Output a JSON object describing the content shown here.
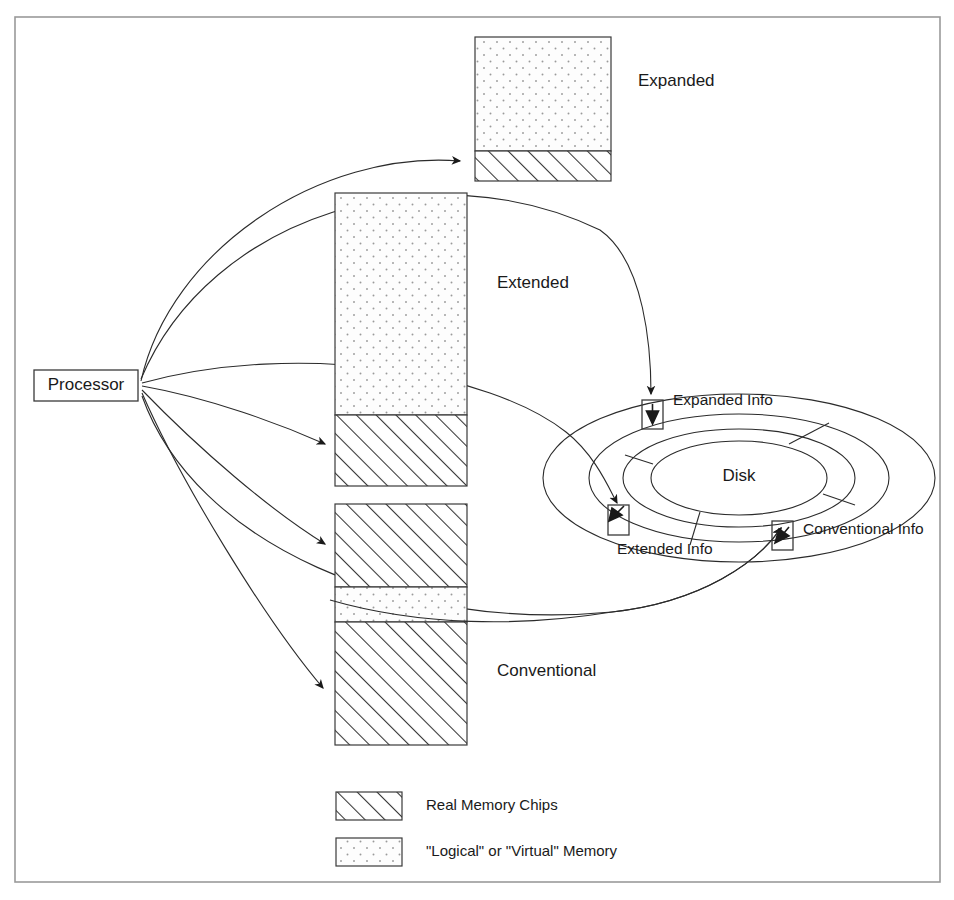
{
  "diagram": {
    "frame": {
      "x": 15,
      "y": 17,
      "width": 925,
      "height": 865
    },
    "colors": {
      "line": "#2b2b2b",
      "box_stroke": "#3a3a3a",
      "frame": "#9a9a9a",
      "text": "#1a1a1a",
      "hatch": "#333333",
      "dot": "#8a8a8a",
      "background": "#ffffff"
    },
    "processor": {
      "label": "Processor",
      "x": 34,
      "y": 370,
      "width": 104,
      "height": 31,
      "fan_origin": {
        "x": 140,
        "y": 384
      }
    },
    "memory_blocks": [
      {
        "name": "expanded",
        "label": "Expanded",
        "label_x": 638,
        "label_y": 86,
        "x": 475,
        "y": 37,
        "width": 136,
        "height": 144,
        "segments": [
          {
            "fill": "dotted",
            "from": 0,
            "to": 114
          },
          {
            "fill": "hatched",
            "from": 114,
            "to": 144
          }
        ]
      },
      {
        "name": "extended",
        "label": "Extended",
        "label_x": 497,
        "label_y": 288,
        "x": 335,
        "y": 193,
        "width": 132,
        "height": 293,
        "segments": [
          {
            "fill": "dotted",
            "from": 0,
            "to": 222
          },
          {
            "fill": "hatched",
            "from": 222,
            "to": 293
          }
        ]
      },
      {
        "name": "conventional",
        "label": "Conventional",
        "label_x": 497,
        "label_y": 676,
        "x": 335,
        "y": 504,
        "width": 132,
        "height": 241,
        "segments": [
          {
            "fill": "hatched",
            "from": 0,
            "to": 83
          },
          {
            "fill": "dotted",
            "from": 83,
            "to": 118
          },
          {
            "fill": "hatched",
            "from": 118,
            "to": 241
          }
        ]
      }
    ],
    "disk": {
      "label": "Disk",
      "label_x": 739,
      "label_y": 477,
      "center_x": 739,
      "center_y": 478,
      "ellipses": [
        {
          "rx": 196,
          "ry": 84
        },
        {
          "rx": 150,
          "ry": 64
        },
        {
          "rx": 116,
          "ry": 49
        },
        {
          "rx": 88,
          "ry": 37
        }
      ],
      "sector_lines": [
        {
          "angle_deg": -55
        },
        {
          "angle_deg": 160
        },
        {
          "angle_deg": 20
        },
        {
          "angle_deg": 108
        }
      ]
    },
    "disk_markers": [
      {
        "name": "expanded-info",
        "label": "Expanded Info",
        "box_x": 642,
        "box_y": 400,
        "box_w": 21,
        "box_h": 29,
        "label_x": 673,
        "label_y": 404,
        "label_anchor": "start",
        "arrow_dir": "down"
      },
      {
        "name": "extended-info",
        "label": "Extended Info",
        "box_x": 608,
        "box_y": 505,
        "box_w": 21,
        "box_h": 30,
        "label_x": 618,
        "label_y": 554,
        "label_anchor": "start",
        "arrow_dir": "down-left"
      },
      {
        "name": "conventional-info",
        "label": "Conventional Info",
        "box_x": 772,
        "box_y": 521,
        "box_w": 21,
        "box_h": 29,
        "label_x": 805,
        "label_y": 535,
        "label_anchor": "start",
        "arrow_dir": "down-left"
      }
    ],
    "connectors": [
      {
        "name": "processor-to-expanded-chips",
        "from": "processor",
        "to": "expanded-memory-hatched",
        "path": "M 141 381 C 170 250 320 150 460 161",
        "arrow": true
      },
      {
        "name": "processor-to-expanded-info",
        "from": "processor",
        "to": "expanded-info-box",
        "path": "M 141 379 C 210 215 430 148 600 230 C 645 262 650 350 651 396",
        "arrow": true
      },
      {
        "name": "processor-to-extended-chips",
        "from": "processor",
        "to": "extended-memory-hatched",
        "path": "M 142 386 C 210 398 280 424 325 444",
        "arrow": true
      },
      {
        "name": "processor-to-extended-info",
        "from": "processor",
        "to": "extended-info-box",
        "path": "M 142 383 C 290 345 480 370 560 430 C 592 464 606 492 614 504",
        "arrow": true
      },
      {
        "name": "processor-to-conventional-chips-upper",
        "from": "processor",
        "to": "conventional-memory-hatched-upper",
        "path": "M 142 390 C 200 450 270 510 325 544",
        "arrow": true
      },
      {
        "name": "processor-to-conventional-chips-lower",
        "from": "processor",
        "to": "conventional-memory-hatched-lower",
        "path": "M 142 393 C 180 480 265 620 323 688",
        "arrow": true
      },
      {
        "name": "processor-to-conventional-info",
        "from": "processor",
        "to": "conventional-info-box",
        "path": "M 142 395 C 200 540 400 630 610 615 C 700 606 756 565 779 530",
        "arrow": true
      }
    ],
    "legend": {
      "items": [
        {
          "name": "real-memory-chips",
          "swatch": "hatched",
          "label": "Real Memory Chips",
          "x": 336,
          "y": 792,
          "w": 66,
          "h": 28
        },
        {
          "name": "logical-virtual-memory",
          "swatch": "dotted",
          "label": "\"Logical\" or \"Virtual\" Memory",
          "x": 336,
          "y": 838,
          "w": 66,
          "h": 28
        }
      ],
      "label_offset_x": 24
    }
  }
}
